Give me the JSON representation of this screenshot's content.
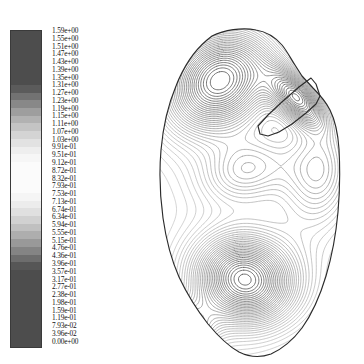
{
  "figure": {
    "type": "contour-plot-with-colorbar",
    "background": "#ffffff"
  },
  "colorbar": {
    "name": "contour-level-colorbar",
    "orientation": "vertical",
    "min": 0.0,
    "max": 1.59,
    "units": "",
    "colormap": "grayscale-dark-light-dark",
    "outline_color": "#3a3a3a",
    "labels": [
      "1.59e+00",
      "1.55e+00",
      "1.51e+00",
      "1.47e+00",
      "1.43e+00",
      "1.39e+00",
      "1.35e+00",
      "1.31e+00",
      "1.27e+00",
      "1.23e+00",
      "1.19e+00",
      "1.15e+00",
      "1.11e+00",
      "1.07e+00",
      "1.03e+00",
      "9.91e-01",
      "9.51e-01",
      "9.12e-01",
      "8.72e-01",
      "8.32e-01",
      "7.93e-01",
      "7.53e-01",
      "7.13e-01",
      "6.74e-01",
      "6.34e-01",
      "5.94e-01",
      "5.55e-01",
      "5.15e-01",
      "4.76e-01",
      "4.36e-01",
      "3.96e-01",
      "3.57e-01",
      "3.17e-01",
      "2.77e-01",
      "2.38e-01",
      "1.98e-01",
      "1.59e-01",
      "1.19e-01",
      "7.93e-02",
      "3.96e-02",
      "0.00e+00"
    ]
  },
  "chart_data": {
    "type": "contour",
    "title": "",
    "xlabel": "",
    "ylabel": "",
    "grid": false,
    "legend_position": "left",
    "colorbar_levels": [
      1.59,
      1.55,
      1.51,
      1.47,
      1.43,
      1.39,
      1.35,
      1.31,
      1.27,
      1.23,
      1.19,
      1.15,
      1.11,
      1.07,
      1.03,
      0.991,
      0.951,
      0.912,
      0.872,
      0.832,
      0.793,
      0.753,
      0.713,
      0.674,
      0.634,
      0.594,
      0.555,
      0.515,
      0.476,
      0.436,
      0.396,
      0.357,
      0.317,
      0.277,
      0.238,
      0.198,
      0.159,
      0.119,
      0.0793,
      0.0396,
      0.0
    ],
    "zmin": 0.0,
    "zmax": 1.59,
    "n_levels": 41,
    "level_step": 0.0396,
    "domain_shape": "irregular-closed-region-with-notch",
    "features": [
      {
        "name": "upper-peak",
        "approx_center_xy": [
          70,
          62
        ],
        "type": "local-maximum",
        "closed_loops": true
      },
      {
        "name": "lower-peak",
        "approx_center_xy": [
          94,
          262
        ],
        "type": "local-maximum",
        "closed_loops": true
      },
      {
        "name": "left-minor-peak",
        "approx_center_xy": [
          30,
          315
        ],
        "type": "local-maximum",
        "closed_loops": true
      },
      {
        "name": "notch-slot",
        "approx_center_xy": [
          140,
          80
        ],
        "type": "boundary-cut",
        "dense_contours": true
      },
      {
        "name": "saddle",
        "approx_center_xy": [
          95,
          150
        ],
        "type": "saddle"
      }
    ]
  }
}
